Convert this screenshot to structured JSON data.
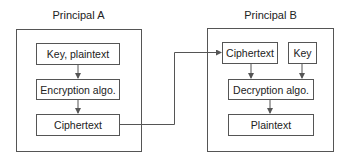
{
  "principal_a": {
    "title": "Principal A",
    "boxes": [
      "Key, plaintext",
      "Encryption algo.",
      "Ciphertext"
    ]
  },
  "principal_b": {
    "title": "Principal B",
    "boxes": [
      "Ciphertext",
      "Key",
      "Decryption algo.",
      "Plaintext"
    ]
  },
  "colors": {
    "line": "#555555",
    "text": "#222222",
    "background": "#ffffff"
  }
}
